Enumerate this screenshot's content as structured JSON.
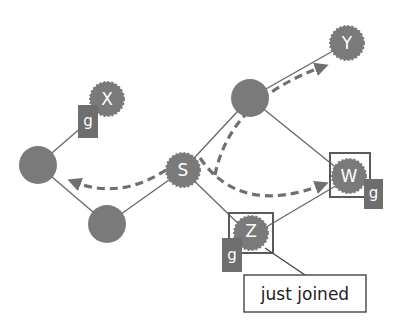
{
  "diagram": {
    "colors": {
      "node_fill": "#7a7a7a",
      "edge": "#6a6a6a",
      "arrow": "#6f6f6f",
      "tag_fill": "#6e6e6e",
      "box_stroke": "#5a5a5a",
      "background": "#ffffff"
    },
    "nodes": [
      {
        "id": "X",
        "label": "X",
        "shape": "spiky"
      },
      {
        "id": "left",
        "label": "",
        "shape": "circle"
      },
      {
        "id": "bottom",
        "label": "",
        "shape": "circle"
      },
      {
        "id": "S",
        "label": "S",
        "shape": "spiky"
      },
      {
        "id": "upper",
        "label": "",
        "shape": "circle"
      },
      {
        "id": "Y",
        "label": "Y",
        "shape": "spiky"
      },
      {
        "id": "W",
        "label": "W",
        "shape": "spiky",
        "boxed": true
      },
      {
        "id": "Z",
        "label": "Z",
        "shape": "spiky",
        "boxed": true
      }
    ],
    "tags": [
      {
        "node": "X",
        "label": "g"
      },
      {
        "node": "W",
        "label": "g"
      },
      {
        "node": "Z",
        "label": "g"
      }
    ],
    "edges": [
      [
        "left",
        "X"
      ],
      [
        "left",
        "bottom"
      ],
      [
        "bottom",
        "S"
      ],
      [
        "S",
        "upper"
      ],
      [
        "upper",
        "Y"
      ],
      [
        "upper",
        "W"
      ],
      [
        "S",
        "Z"
      ],
      [
        "Z",
        "W"
      ]
    ],
    "arrows": [
      {
        "from": "S",
        "to": "left",
        "style": "dashed"
      },
      {
        "from": "S",
        "to": "Y",
        "style": "dashed"
      },
      {
        "from": "S",
        "to": "W",
        "style": "dashed"
      }
    ],
    "callout": {
      "target": "Z",
      "text": "just joined"
    }
  }
}
